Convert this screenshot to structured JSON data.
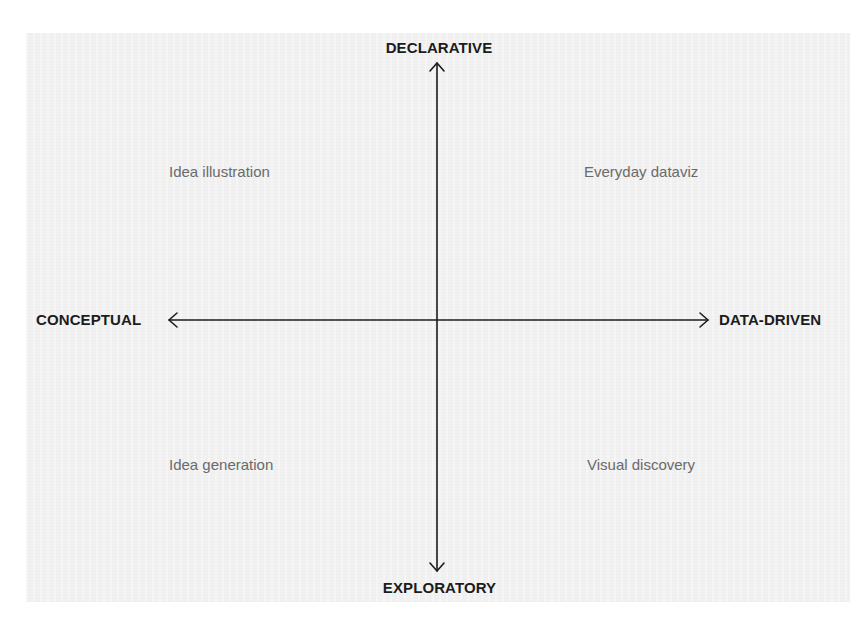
{
  "diagram": {
    "type": "quadrant",
    "axes": {
      "vertical": {
        "top_label": "DECLARATIVE",
        "bottom_label": "EXPLORATORY"
      },
      "horizontal": {
        "left_label": "CONCEPTUAL",
        "right_label": "DATA-DRIVEN"
      }
    },
    "quadrants": {
      "top_left": "Idea illustration",
      "top_right": "Everyday dataviz",
      "bottom_left": "Idea generation",
      "bottom_right": "Visual discovery"
    },
    "colors": {
      "panel_background": "#f1f1f1",
      "axis_line": "#1c1c1c",
      "axis_label": "#1c1c1c",
      "quadrant_label": "#6a6a6a"
    }
  }
}
